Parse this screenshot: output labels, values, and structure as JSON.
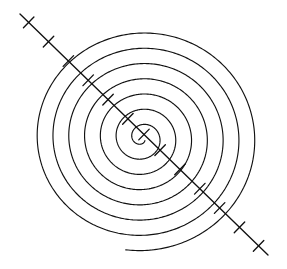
{
  "figure": {
    "background_color": "#ffffff",
    "stroke_color": "#111111",
    "width": 287,
    "height": 269
  },
  "chart_data": {
    "type": "line",
    "title": "",
    "subtitle": "",
    "xlabel": "",
    "ylabel": "",
    "grid": false,
    "legend": null,
    "annotations": [],
    "xlim": [
      0,
      287
    ],
    "ylim": [
      0,
      269
    ],
    "series": [
      {
        "name": "spiral",
        "kind": "archimedean-spiral",
        "center": [
          142,
          138
        ],
        "turns": 7.15,
        "theta_start_deg": 0,
        "theta_end_deg": 2574,
        "r_start": 4,
        "r_end": 117,
        "radial_pitch_per_turn": 15.8,
        "x_radius_scale": 1.0,
        "y_radius_scale": 0.965,
        "rotation_deg": 44,
        "stroke": "#111111",
        "stroke_width": 1.15,
        "ring_radii_at_right": [
          11,
          26,
          42,
          58,
          74,
          90,
          106,
          117
        ]
      },
      {
        "name": "diagonal-axis",
        "kind": "line-with-ticks",
        "x": [
          20,
          268
        ],
        "y": [
          14,
          255
        ],
        "angle_deg": 44.2,
        "length": 345,
        "stroke": "#111111",
        "stroke_width": 1.35,
        "tick_count": 13,
        "tick_half_length": 7.5,
        "tick_spacing": 26.5,
        "tick_positions_t": [
          0.035,
          0.115,
          0.195,
          0.275,
          0.355,
          0.435,
          0.5,
          0.565,
          0.645,
          0.725,
          0.805,
          0.885,
          0.962
        ]
      }
    ]
  }
}
